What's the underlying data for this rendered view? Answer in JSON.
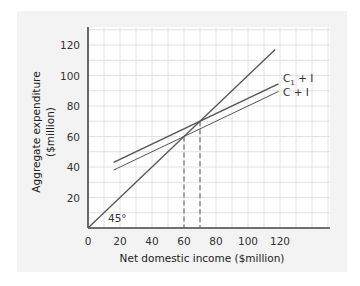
{
  "chart_data": {
    "type": "line",
    "title": "",
    "xlabel": "Net domestic income ($million)",
    "ylabel_line1": "Aggregate expenditure",
    "ylabel_line2": "($million)",
    "xlim": [
      0,
      120
    ],
    "ylim": [
      0,
      120
    ],
    "x_ticks": [
      "0",
      "20",
      "40",
      "60",
      "80",
      "100",
      "120"
    ],
    "y_ticks": [
      "20",
      "40",
      "60",
      "80",
      "100",
      "120"
    ],
    "grid": true,
    "series": [
      {
        "name": "45° line",
        "x": [
          0,
          117
        ],
        "y": [
          0,
          117
        ]
      },
      {
        "name": "C1 + I",
        "x": [
          16,
          119
        ],
        "y": [
          43,
          94.5
        ]
      },
      {
        "name": "C + I",
        "x": [
          16,
          119
        ],
        "y": [
          38,
          89.5
        ]
      }
    ],
    "equilibria": [
      {
        "series": "C + I",
        "x": 60,
        "y": 60
      },
      {
        "series": "C1 + I",
        "x": 70,
        "y": 70
      }
    ],
    "annotations": {
      "angle": "45°",
      "c1_label_main": "C",
      "c1_label_sub": "1",
      "c1_label_rest": " + I",
      "c_label": "C + I"
    }
  },
  "colors": {
    "panel": "#f3f3f3",
    "grid": "#e2e2e2",
    "axis": "#444444",
    "line": "#555555"
  }
}
